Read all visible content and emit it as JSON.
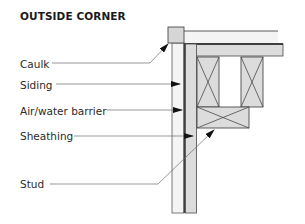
{
  "title": "OUTSIDE CORNER",
  "labels": {
    "caulk": "Caulk",
    "siding": "Siding",
    "barrier": "Air/water barrier",
    "sheathing": "Sheathing",
    "stud": "Stud"
  },
  "colors": {
    "outline": "#4a4a4a",
    "fill_light": "#f2f2f2",
    "fill_gray": "#d9d9d9",
    "barrier_line": "#4d4d4d",
    "leader": "#6b6b6b",
    "arrow": "#111111"
  }
}
